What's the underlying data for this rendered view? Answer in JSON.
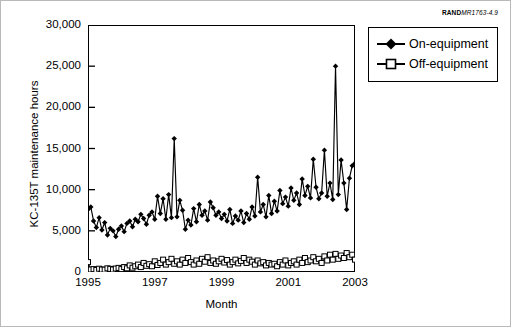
{
  "figure": {
    "source_tag_bold": "RAND",
    "source_tag_italic": "MR1763-4.9"
  },
  "legend": {
    "position": "top-right-outside",
    "items": [
      {
        "label": "On-equipment",
        "marker": "filled-diamond",
        "color": "#000000"
      },
      {
        "label": "Off-equipment",
        "marker": "open-square",
        "color": "#000000"
      }
    ]
  },
  "chart_data": {
    "type": "line",
    "title": "",
    "subtitle": "",
    "xlabel": "Month",
    "ylabel": "KC-135T maintenance hours",
    "grid": false,
    "xlim": [
      1995.0,
      2003.0
    ],
    "ylim": [
      0,
      30000
    ],
    "yticks": [
      0,
      5000,
      10000,
      15000,
      20000,
      25000,
      30000
    ],
    "ytick_labels": [
      "0",
      "5,000",
      "10,000",
      "15,000",
      "20,000",
      "25,000",
      "30,000"
    ],
    "xticks": [
      1995,
      1997,
      1999,
      2001,
      2003
    ],
    "xtick_labels": [
      "1995",
      "1997",
      "1999",
      "2001",
      "2003"
    ],
    "x_start": 1995.0,
    "x_step_years": 0.08333333,
    "series": [
      {
        "name": "On-equipment",
        "marker": "filled-diamond",
        "color": "#000000",
        "values": [
          7600,
          7900,
          6200,
          5400,
          6600,
          5100,
          6000,
          4500,
          5300,
          5000,
          4300,
          5200,
          5600,
          4900,
          5900,
          6200,
          5500,
          6400,
          6100,
          7000,
          6500,
          5800,
          6900,
          7300,
          6400,
          9200,
          7100,
          8900,
          6400,
          9400,
          6600,
          16200,
          6700,
          8700,
          7500,
          5200,
          6300,
          5700,
          7700,
          6100,
          8200,
          6900,
          7400,
          6300,
          8500,
          7800,
          6900,
          7300,
          6500,
          7000,
          6200,
          7600,
          5900,
          6800,
          6300,
          7400,
          6000,
          7100,
          6400,
          7900,
          6800,
          11500,
          7300,
          8200,
          6700,
          9300,
          7100,
          8600,
          7400,
          9900,
          8300,
          9100,
          8000,
          10200,
          8700,
          9600,
          8200,
          11300,
          9300,
          10400,
          9000,
          13700,
          10300,
          8900,
          9600,
          14800,
          9200,
          10800,
          8800,
          25000,
          9400,
          13600,
          10800,
          7600,
          11400,
          12900,
          13200,
          9200,
          26000,
          8800,
          19000,
          10400,
          12500,
          11200,
          13400,
          12100,
          14600,
          13000,
          15300,
          14100,
          16100,
          18500
        ]
      },
      {
        "name": "Off-equipment",
        "marker": "open-square",
        "color": "#000000",
        "values": [
          1200,
          300,
          350,
          250,
          400,
          300,
          280,
          450,
          380,
          300,
          420,
          500,
          350,
          600,
          450,
          800,
          520,
          700,
          900,
          600,
          1100,
          750,
          950,
          700,
          1300,
          850,
          1100,
          1500,
          900,
          1200,
          1600,
          1000,
          1300,
          900,
          1500,
          1100,
          1700,
          1200,
          900,
          1400,
          1000,
          1600,
          1250,
          1800,
          1100,
          1400,
          1000,
          1300,
          1600,
          1150,
          1450,
          900,
          1200,
          1500,
          1050,
          1350,
          1700,
          1100,
          1500,
          1250,
          900,
          1400,
          1050,
          1200,
          800,
          1100,
          900,
          1000,
          700,
          1200,
          900,
          1400,
          800,
          1100,
          1300,
          900,
          1500,
          1100,
          1700,
          1200,
          1400,
          1800,
          1300,
          1600,
          1100,
          1900,
          1400,
          2100,
          1500,
          2200,
          1600,
          2000,
          1700,
          2300,
          1800,
          2100,
          1500,
          2200,
          1700,
          2000,
          1600,
          2100,
          1400,
          1900,
          1600,
          1800,
          1500,
          1700,
          1400,
          1600,
          1200,
          1000
        ]
      }
    ]
  }
}
